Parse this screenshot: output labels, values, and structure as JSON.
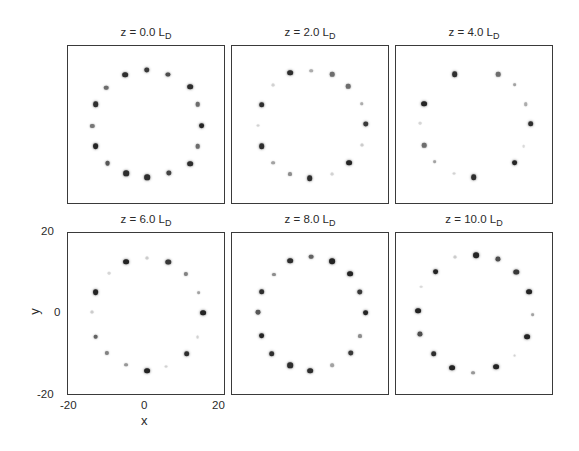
{
  "chart_data": {
    "type": "scatter",
    "title": "",
    "layout": {
      "rows": 2,
      "cols": 3,
      "grid": false,
      "legend": "none"
    },
    "xlabel": "x",
    "ylabel": "y",
    "xlim": [
      -20,
      20
    ],
    "ylim": [
      -20,
      20
    ],
    "xticks": [
      "-20",
      "0",
      "20"
    ],
    "yticks": [
      "20",
      "0",
      "-20"
    ],
    "panels": [
      {
        "title": "z = 0.0 L",
        "title_sub": "D",
        "z": 0.0,
        "points": [
          [
            0,
            14,
            0.85
          ],
          [
            -5.5,
            12.8,
            0.9
          ],
          [
            5.3,
            12.8,
            0.75
          ],
          [
            10.9,
            9.8,
            0.9
          ],
          [
            -10.3,
            9.5,
            0.6
          ],
          [
            12.8,
            5.3,
            0.6
          ],
          [
            -13,
            5.3,
            0.9
          ],
          [
            13.8,
            0,
            0.95
          ],
          [
            -13.8,
            0,
            0.55
          ],
          [
            12.8,
            -5.2,
            0.6
          ],
          [
            -13,
            -5.2,
            0.95
          ],
          [
            10.9,
            -9.6,
            0.9
          ],
          [
            -10,
            -9.4,
            0.7
          ],
          [
            5.5,
            -12,
            0.8
          ],
          [
            -5.3,
            -12,
            0.9
          ],
          [
            0,
            -13,
            0.9
          ]
        ]
      },
      {
        "title": "z = 2.0 L",
        "title_sub": "D",
        "z": 2.0,
        "points": [
          [
            -5.3,
            13.2,
            0.9
          ],
          [
            0,
            13.7,
            0.3
          ],
          [
            5.3,
            12.9,
            0.6
          ],
          [
            9.4,
            9.9,
            0.6
          ],
          [
            -9.6,
            10.2,
            0.12
          ],
          [
            12.8,
            5.5,
            0.3
          ],
          [
            -12.5,
            5.2,
            0.9
          ],
          [
            13.8,
            0.3,
            0.85
          ],
          [
            -13.3,
            0,
            0.12
          ],
          [
            12.8,
            -4.9,
            0.15
          ],
          [
            -12.5,
            -5.2,
            0.9
          ],
          [
            9.6,
            -9.4,
            0.95
          ],
          [
            -9.6,
            -9.4,
            0.35
          ],
          [
            -5.3,
            -12.3,
            0.45
          ],
          [
            5.3,
            -12.3,
            0.12
          ],
          [
            -0.3,
            -13.3,
            0.9
          ]
        ]
      },
      {
        "title": "z = 4.0 L",
        "title_sub": "D",
        "z": 4.0,
        "points": [
          [
            -5.1,
            12.9,
            0.9
          ],
          [
            5.9,
            12.9,
            0.6
          ],
          [
            10,
            10.2,
            0.35
          ],
          [
            -12.8,
            5.5,
            0.95
          ],
          [
            12.8,
            5.3,
            0.3
          ],
          [
            -14,
            0.6,
            0.1
          ],
          [
            14.1,
            0.4,
            0.9
          ],
          [
            12.3,
            -5.2,
            0.08
          ],
          [
            -12.8,
            -5,
            0.6
          ],
          [
            -10.2,
            -9.1,
            0.35
          ],
          [
            10,
            -9.4,
            0.95
          ],
          [
            -5.4,
            -12.1,
            0.12
          ],
          [
            -0.3,
            -13,
            0.9
          ]
        ]
      },
      {
        "title": "z = 6.0 L",
        "title_sub": "D",
        "z": 6.0,
        "points": [
          [
            -5.3,
            12.9,
            0.95
          ],
          [
            0,
            13.9,
            0.15
          ],
          [
            5.4,
            12.9,
            0.85
          ],
          [
            9.9,
            10,
            0.5
          ],
          [
            -9.5,
            10.2,
            0.1
          ],
          [
            13.1,
            5.3,
            0.35
          ],
          [
            -13,
            5.4,
            0.95
          ],
          [
            14.1,
            0.4,
            0.95
          ],
          [
            -13.9,
            0.6,
            0.15
          ],
          [
            12.8,
            -5.5,
            0.12
          ],
          [
            -13,
            -5.4,
            0.65
          ],
          [
            10,
            -9.6,
            0.9
          ],
          [
            -10.2,
            -9.4,
            0.5
          ],
          [
            -5.3,
            -12.3,
            0.4
          ],
          [
            0,
            -13.8,
            0.95
          ],
          [
            4.9,
            -12.8,
            0.12
          ]
        ]
      },
      {
        "title": "z = 8.0 L",
        "title_sub": "D",
        "z": 8.0,
        "points": [
          [
            -5.3,
            13.2,
            0.9
          ],
          [
            0,
            14.2,
            0.65
          ],
          [
            5.3,
            13.1,
            0.95
          ],
          [
            9.8,
            10,
            0.95
          ],
          [
            -9.4,
            9.8,
            0.45
          ],
          [
            12.3,
            5.5,
            0.85
          ],
          [
            -12.5,
            5.5,
            0.9
          ],
          [
            13.8,
            0.4,
            0.95
          ],
          [
            -13.3,
            0.5,
            0.7
          ],
          [
            12.5,
            -5.2,
            0.45
          ],
          [
            -12.5,
            -5.2,
            0.95
          ],
          [
            10,
            -9.4,
            0.85
          ],
          [
            -10,
            -9.7,
            0.9
          ],
          [
            -5.3,
            -12.5,
            0.9
          ],
          [
            5.3,
            -12.5,
            0.35
          ],
          [
            -0.2,
            -13.8,
            0.9
          ]
        ]
      },
      {
        "title": "z = 10.0 L",
        "title_sub": "D",
        "z": 10.0,
        "points": [
          [
            0.3,
            14.6,
            0.95
          ],
          [
            -5.1,
            14,
            0.15
          ],
          [
            5.9,
            13.7,
            0.75
          ],
          [
            10.5,
            10.5,
            0.85
          ],
          [
            -10,
            10.5,
            0.95
          ],
          [
            13.6,
            5.6,
            0.95
          ],
          [
            -13.6,
            6.8,
            0.08
          ],
          [
            -14.4,
            0.9,
            0.95
          ],
          [
            14.6,
            0,
            0.35
          ],
          [
            -13.9,
            -4.9,
            0.75
          ],
          [
            13.1,
            -5.4,
            0.95
          ],
          [
            -10.5,
            -9.6,
            0.9
          ],
          [
            10,
            -10.1,
            0.12
          ],
          [
            -5.9,
            -13.1,
            0.95
          ],
          [
            5.4,
            -12.8,
            0.95
          ],
          [
            -0.5,
            -14.3,
            0.4
          ]
        ]
      }
    ]
  },
  "axes": {
    "x_label": "x",
    "y_label": "y",
    "x_ticks": [
      "-20",
      "0",
      "20"
    ],
    "y_ticks": [
      "20",
      "0",
      "-20"
    ]
  },
  "colors": {
    "spot": "#1e1e1e",
    "frame": "#3a3a3a",
    "background": "#ffffff"
  }
}
